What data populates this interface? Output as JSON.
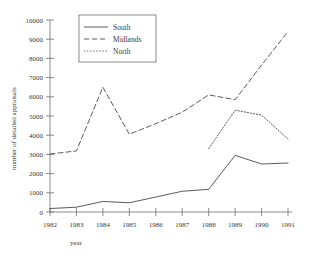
{
  "chart_data": {
    "type": "line",
    "title": "",
    "xlabel": "year",
    "ylabel": "number of detailed appraisals",
    "x": [
      1982,
      1983,
      1984,
      1985,
      1986,
      1987,
      1988,
      1989,
      1990,
      1991
    ],
    "categories": [
      "1982",
      "1983",
      "1984",
      "1985",
      "1986",
      "1987",
      "1988",
      "1989",
      "1990",
      "1991"
    ],
    "xlim": [
      1982,
      1991
    ],
    "ylim": [
      0,
      10000
    ],
    "grid": false,
    "legend_position": "top-left",
    "y_ticks": [
      0,
      1000,
      2000,
      3000,
      4000,
      5000,
      6000,
      7000,
      8000,
      9000,
      10000
    ],
    "y_tick_labels": [
      "0",
      "1000",
      "2000",
      "3000",
      "4000",
      "5000",
      "6000",
      "7000",
      "8000",
      "9000",
      "10000"
    ],
    "x_ticks": [
      1982,
      1983,
      1984,
      1985,
      1986,
      1987,
      1988,
      1989,
      1990,
      1991
    ],
    "x_tick_labels": [
      "1982",
      "1983",
      "1984",
      "1985",
      "1986",
      "1987",
      "1988",
      "1989",
      "1990",
      "1991"
    ],
    "series": [
      {
        "name": "South",
        "style": "solid",
        "color": "#4a4a4a",
        "x": [
          1982,
          1983,
          1984,
          1985,
          1986,
          1987,
          1988,
          1989,
          1990,
          1991
        ],
        "values": [
          180,
          250,
          550,
          480,
          780,
          1080,
          1180,
          2950,
          2500,
          2550
        ]
      },
      {
        "name": "Midlands",
        "style": "dashed",
        "color": "#4a4a4a",
        "x": [
          1982,
          1983,
          1984,
          1985,
          1986,
          1987,
          1988,
          1989,
          1990,
          1991
        ],
        "values": [
          3020,
          3180,
          6500,
          4050,
          4600,
          5200,
          6100,
          5850,
          7650,
          9400
        ]
      },
      {
        "name": "North",
        "style": "dotted",
        "color": "#4a4a4a",
        "x": [
          1988,
          1989,
          1990,
          1991
        ],
        "values": [
          3300,
          5300,
          5050,
          3800
        ]
      }
    ]
  },
  "legend": {
    "entries": [
      {
        "label": "South"
      },
      {
        "label": "Midlands"
      },
      {
        "label": "North"
      }
    ]
  },
  "axes": {
    "y_title": "number of detailed appraisals",
    "x_title": "year"
  }
}
